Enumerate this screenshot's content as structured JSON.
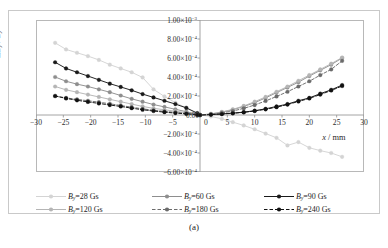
{
  "caption": "(a)",
  "axes": {
    "y_title_delta": "Δ",
    "y_title": "B",
    "y_sub": "y",
    "y_denom": "B",
    "y_denom_sub": "y",
    "x_title": "x",
    "x_unit": "/ mm",
    "x_ticks": [
      "−30",
      "−25",
      "−20",
      "−15",
      "−10",
      "−5",
      "0",
      "5",
      "10",
      "15",
      "20",
      "25",
      "30"
    ],
    "y_ticks": [
      "1.00×10",
      "8.00×10",
      "6.00×10",
      "4.00×10",
      "2.00×10",
      "0.00",
      "−2.00×10",
      "−4.00×10",
      "−6.00×10"
    ],
    "y_tick_exps": [
      "−3",
      "−4",
      "−4",
      "−4",
      "−4",
      "",
      "−4",
      "−4",
      "−4"
    ],
    "zero_label": "0.00"
  },
  "legend": [
    {
      "label_sym": "B",
      "label_sub": "y",
      "label_rest": "=28 Gs",
      "color": "#d4d4d4",
      "dash": "none",
      "marker": "circle"
    },
    {
      "label_sym": "B",
      "label_sub": "y",
      "label_rest": "=60 Gs",
      "color": "#8e8e8e",
      "dash": "none",
      "marker": "circle"
    },
    {
      "label_sym": "B",
      "label_sub": "y",
      "label_rest": "=90 Gs",
      "color": "#1a1a1a",
      "dash": "none",
      "marker": "circle"
    },
    {
      "label_sym": "B",
      "label_sub": "y",
      "label_rest": "=120 Gs",
      "color": "#b5b5b5",
      "dash": "none",
      "marker": "circle"
    },
    {
      "label_sym": "B",
      "label_sub": "y",
      "label_rest": "=180 Gs",
      "color": "#6b6b6b",
      "dash": "dashed",
      "marker": "circle"
    },
    {
      "label_sym": "B",
      "label_sub": "y",
      "label_rest": "=240 Gs",
      "color": "#111111",
      "dash": "dashed",
      "marker": "circle"
    }
  ],
  "chart_data": {
    "type": "line",
    "title": "",
    "xlabel": "x / mm",
    "ylabel": "ΔB_y / B_y",
    "xlim": [
      -30,
      30
    ],
    "ylim": [
      -0.0006,
      0.001
    ],
    "grid": false,
    "legend_position": "below",
    "x": [
      -26.5,
      -24.5,
      -22.5,
      -20.5,
      -18.5,
      -16.5,
      -14.5,
      -12.5,
      -10.5,
      -8.5,
      -6.5,
      -4.5,
      -2.5,
      -0.5,
      0,
      2,
      4,
      6,
      8,
      10,
      12,
      14,
      16,
      18,
      20,
      22,
      24,
      26
    ],
    "series": [
      {
        "name": "B_y=28 Gs",
        "color": "#d4d4d4",
        "dash": "none",
        "values": [
          0.00076,
          0.00069,
          0.000655,
          0.00062,
          0.00058,
          0.00053,
          0.00049,
          0.00045,
          0.000395,
          0.00027,
          0.000195,
          0.00013,
          7.5e-05,
          1e-05,
          0.0,
          -1.5e-05,
          -4e-05,
          -7.5e-05,
          -0.00011,
          -0.00015,
          -0.000195,
          -0.00024,
          -0.00032,
          -0.000285,
          -0.000345,
          -0.000375,
          -0.0004,
          -0.00044
        ]
      },
      {
        "name": "B_y=60 Gs",
        "color": "#8e8e8e",
        "dash": "none",
        "values": [
          0.0004,
          0.000355,
          0.000325,
          0.0003,
          0.00027,
          0.00024,
          0.000205,
          0.00017,
          0.00014,
          0.00011,
          8.5e-05,
          6e-05,
          3.5e-05,
          8e-06,
          0.0,
          1e-05,
          3e-05,
          5.5e-05,
          9e-05,
          0.00013,
          0.00018,
          0.000235,
          0.00029,
          0.000345,
          0.00041,
          0.00047,
          0.00053,
          0.0006
        ]
      },
      {
        "name": "B_y=90 Gs",
        "color": "#1a1a1a",
        "dash": "none",
        "values": [
          0.000555,
          0.00049,
          0.00045,
          0.00041,
          0.00037,
          0.00033,
          0.000295,
          0.00026,
          0.00022,
          0.000185,
          0.00015,
          0.000115,
          7.5e-05,
          2e-05,
          0.0,
          5e-06,
          1.2e-05,
          2e-05,
          3e-05,
          4.5e-05,
          6.5e-05,
          9e-05,
          0.000115,
          0.00015,
          0.00018,
          0.000225,
          0.000265,
          0.000315
        ]
      },
      {
        "name": "B_y=120 Gs",
        "color": "#b5b5b5",
        "dash": "none",
        "values": [
          0.0003,
          0.000265,
          0.00024,
          0.000215,
          0.00019,
          0.000165,
          0.00014,
          0.000115,
          9e-05,
          7e-05,
          5.5e-05,
          4e-05,
          2.5e-05,
          5e-06,
          0.0,
          1.2e-05,
          3.2e-05,
          6e-05,
          9.5e-05,
          0.00014,
          0.00019,
          0.000245,
          0.0003,
          0.00036,
          0.00042,
          0.00048,
          0.00054,
          0.000605
        ]
      },
      {
        "name": "B_y=180 Gs",
        "color": "#6b6b6b",
        "dash": "dashed",
        "values": [
          0.0002,
          0.00018,
          0.000165,
          0.00015,
          0.000135,
          0.000118,
          0.0001,
          8.2e-05,
          6.5e-05,
          5e-05,
          3.8e-05,
          2.8e-05,
          1.8e-05,
          4e-06,
          0.0,
          8e-06,
          2.2e-05,
          4.2e-05,
          7e-05,
          0.000105,
          0.000148,
          0.000195,
          0.000245,
          0.0003,
          0.000355,
          0.00042,
          0.00048,
          0.00057
        ]
      },
      {
        "name": "B_y=240 Gs",
        "color": "#111111",
        "dash": "dashed",
        "values": [
          0.0002,
          0.000175,
          0.000155,
          0.000138,
          0.000122,
          0.000105,
          9e-05,
          7.2e-05,
          5.5e-05,
          4.2e-05,
          3e-05,
          2e-05,
          1.2e-05,
          2e-06,
          0.0,
          4e-06,
          1e-05,
          1.8e-05,
          2.8e-05,
          4.2e-05,
          6e-05,
          8.2e-05,
          0.00011,
          0.000142,
          0.000175,
          0.000215,
          0.000258,
          0.000305
        ]
      }
    ]
  }
}
